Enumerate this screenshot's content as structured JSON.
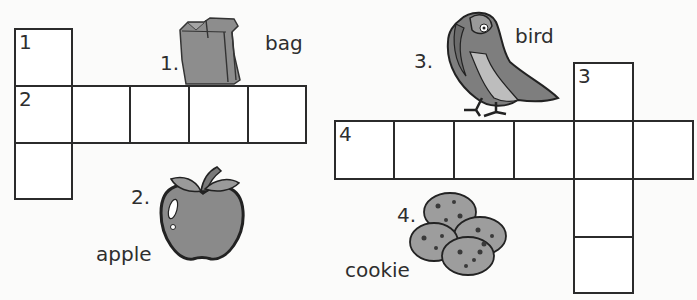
{
  "puzzle": {
    "clue_numbers_in_grid": {
      "c1": "1",
      "c2": "2",
      "c3": "3",
      "c4": "4"
    },
    "clues": [
      {
        "number": "1.",
        "word": "bag",
        "icon": "paper-bag-icon",
        "direction": "down"
      },
      {
        "number": "2.",
        "word": "apple",
        "icon": "apple-icon",
        "direction": "across"
      },
      {
        "number": "3.",
        "word": "bird",
        "icon": "bird-icon",
        "direction": "down"
      },
      {
        "number": "4.",
        "word": "cookie",
        "icon": "cookies-icon",
        "direction": "across"
      }
    ]
  },
  "colors": {
    "grid_line": "#2b2b2b",
    "illustration_fill": "#8a8a8a",
    "background": "#fbfbfa"
  }
}
